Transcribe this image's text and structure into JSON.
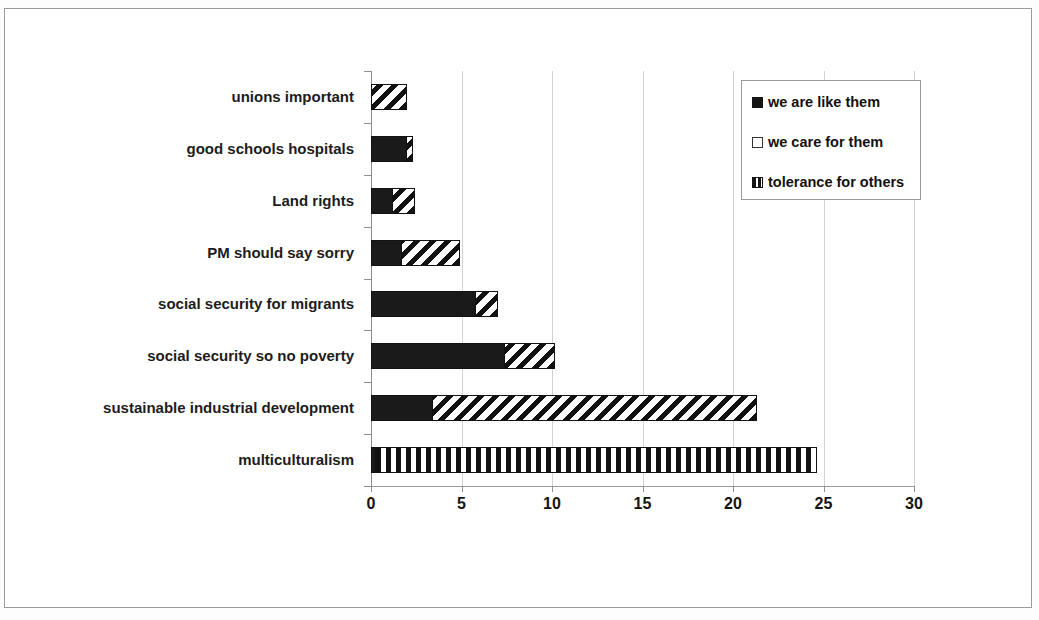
{
  "chart_data": {
    "type": "bar",
    "orientation": "horizontal",
    "stacked": true,
    "title": "",
    "xlabel": "",
    "ylabel": "",
    "xlim": [
      0,
      30
    ],
    "xticks": [
      0,
      5,
      10,
      15,
      20,
      25,
      30
    ],
    "xtick_labels": [
      "0",
      "5",
      "10",
      "15",
      "20",
      "25",
      "30"
    ],
    "grid": true,
    "grid_axis": "x",
    "legend_position": "upper right",
    "categories": [
      "unions important",
      "good schools hospitals",
      "Land rights",
      "PM should say sorry",
      "social security for migrants",
      "social security so no poverty",
      "sustainable industrial development",
      "multiculturalism"
    ],
    "series": [
      {
        "name": "we are like them",
        "pattern": "solid-black",
        "values": [
          0,
          2.0,
          1.2,
          1.7,
          5.8,
          7.4,
          3.4,
          0.3
        ]
      },
      {
        "name": "we care for them",
        "pattern": "diagonal-hatch",
        "values": [
          2.0,
          0.4,
          1.3,
          3.3,
          1.3,
          2.8,
          18.0,
          0
        ]
      },
      {
        "name": "tolerance for others",
        "pattern": "vertical-stripes",
        "values": [
          0,
          0,
          0,
          0,
          0,
          0,
          0,
          24.4
        ]
      }
    ],
    "totals": [
      2.0,
      2.4,
      2.5,
      5.0,
      7.1,
      10.2,
      21.4,
      24.7
    ]
  },
  "legend": {
    "items": [
      {
        "label": "we are like them",
        "swatch": "solid-black-square-icon"
      },
      {
        "label": "we care for them",
        "swatch": "outlined-square-icon"
      },
      {
        "label": "tolerance for others",
        "swatch": "vertical-stripe-square-icon"
      }
    ]
  },
  "colors": {
    "bar_fill": "#111111",
    "bar_background": "#ffffff",
    "gridline": "#d3d3d3",
    "axis": "#9a9a9a",
    "frame": "#9a9a9a",
    "text": "#111111"
  }
}
